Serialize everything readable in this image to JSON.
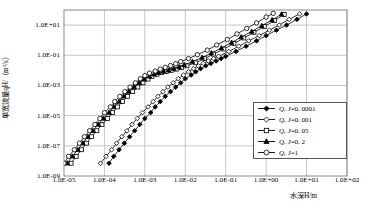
{
  "chart_data": {
    "type": "line",
    "title": "",
    "xlabel": "水深H/m",
    "ylabel": "单宽流量qH/（m³/s）",
    "xscale": "log",
    "yscale": "log",
    "xlim": [
      1e-05,
      100.0
    ],
    "ylim": [
      1e-09,
      100.0
    ],
    "grid": true,
    "xtick_labels": [
      "1.0E-05",
      "1.0E-04",
      "1.0E-03",
      "1.0E-02",
      "1.0E-01",
      "1.0E+00",
      "1.0E+01",
      "1.0E+02"
    ],
    "xtick_values": [
      1e-05,
      0.0001,
      0.001,
      0.01,
      0.1,
      1,
      10,
      100
    ],
    "ytick_labels": [
      "1.0E-09",
      "1.0E-07",
      "1.0E-05",
      "1.0E-03",
      "1.0E-01",
      "1.0E+01"
    ],
    "ytick_values": [
      1e-09,
      1e-07,
      1e-05,
      0.001,
      0.1,
      10
    ],
    "legend_position": "lower-right",
    "series": [
      {
        "name": "Q, J=0.0001",
        "marker": "filled-diamond",
        "points": [
          [
            0.00013,
            7e-09
          ],
          [
            0.00017,
            2e-08
          ],
          [
            0.00023,
            5.5e-08
          ],
          [
            0.00031,
            1.5e-07
          ],
          [
            0.00042,
            4e-07
          ],
          [
            0.00056,
            1e-06
          ],
          [
            0.00075,
            2.6e-06
          ],
          [
            0.001,
            6.5e-06
          ],
          [
            0.0014,
            1.6e-05
          ],
          [
            0.0018,
            3.8e-05
          ],
          [
            0.0024,
            8.5e-05
          ],
          [
            0.0032,
            0.00019
          ],
          [
            0.0043,
            0.00039
          ],
          [
            0.0058,
            0.00078
          ],
          [
            0.0077,
            0.0015
          ],
          [
            0.01,
            0.0028
          ],
          [
            0.014,
            0.0049
          ],
          [
            0.018,
            0.008
          ],
          [
            0.024,
            0.013
          ],
          [
            0.032,
            0.02
          ],
          [
            0.043,
            0.029
          ],
          [
            0.058,
            0.042
          ],
          [
            0.077,
            0.06
          ],
          [
            0.1,
            0.085
          ],
          [
            0.18,
            0.18
          ],
          [
            0.32,
            0.4
          ],
          [
            0.58,
            0.9
          ],
          [
            1.0,
            2.0
          ],
          [
            1.8,
            4.6
          ],
          [
            3.2,
            10.0
          ],
          [
            5.8,
            24.0
          ],
          [
            10.0,
            55.0
          ]
        ]
      },
      {
        "name": "Q, J=0.001",
        "marker": "open-diamond",
        "points": [
          [
            8e-05,
            7e-09
          ],
          [
            0.00011,
            2e-08
          ],
          [
            0.00015,
            5.5e-08
          ],
          [
            0.0002,
            1.5e-07
          ],
          [
            0.00027,
            4e-07
          ],
          [
            0.00036,
            1e-06
          ],
          [
            0.00048,
            2.6e-06
          ],
          [
            0.00065,
            6.5e-06
          ],
          [
            0.00087,
            1.6e-05
          ],
          [
            0.0012,
            3.8e-05
          ],
          [
            0.0016,
            8.5e-05
          ],
          [
            0.0021,
            0.00019
          ],
          [
            0.0028,
            0.00039
          ],
          [
            0.0037,
            0.00078
          ],
          [
            0.005,
            0.0015
          ],
          [
            0.0067,
            0.0028
          ],
          [
            0.009,
            0.0049
          ],
          [
            0.012,
            0.008
          ],
          [
            0.016,
            0.013
          ],
          [
            0.021,
            0.02
          ],
          [
            0.028,
            0.029
          ],
          [
            0.037,
            0.042
          ],
          [
            0.05,
            0.06
          ],
          [
            0.067,
            0.085
          ],
          [
            0.12,
            0.18
          ],
          [
            0.21,
            0.4
          ],
          [
            0.37,
            0.9
          ],
          [
            0.67,
            2.0
          ],
          [
            1.2,
            4.6
          ],
          [
            2.1,
            10.0
          ],
          [
            3.7,
            24.0
          ],
          [
            6.7,
            55.0
          ]
        ]
      },
      {
        "name": "Q, J=0.05",
        "marker": "open-square",
        "points": [
          [
            1.5e-05,
            7e-09
          ],
          [
            2e-05,
            2e-08
          ],
          [
            2.7e-05,
            5.5e-08
          ],
          [
            3.6e-05,
            1.5e-07
          ],
          [
            4.8e-05,
            4e-07
          ],
          [
            6.5e-05,
            1e-06
          ],
          [
            8.7e-05,
            2.6e-06
          ],
          [
            0.00012,
            6.5e-06
          ],
          [
            0.00016,
            1.6e-05
          ],
          [
            0.00021,
            3.8e-05
          ],
          [
            0.00028,
            8.5e-05
          ],
          [
            0.00037,
            0.00019
          ],
          [
            0.0005,
            0.00039
          ],
          [
            0.00067,
            0.00078
          ],
          [
            0.0009,
            0.0015
          ],
          [
            0.0012,
            0.0026
          ],
          [
            0.0015,
            0.004
          ],
          [
            0.002,
            0.0055
          ],
          [
            0.0026,
            0.007
          ],
          [
            0.0034,
            0.0085
          ],
          [
            0.0045,
            0.01
          ],
          [
            0.006,
            0.012
          ],
          [
            0.008,
            0.015
          ],
          [
            0.011,
            0.02
          ],
          [
            0.018,
            0.032
          ],
          [
            0.03,
            0.06
          ],
          [
            0.05,
            0.12
          ],
          [
            0.09,
            0.26
          ],
          [
            0.16,
            0.6
          ],
          [
            0.28,
            1.4
          ],
          [
            0.5,
            3.3
          ],
          [
            0.9,
            8.0
          ],
          [
            1.6,
            20.0
          ],
          [
            2.8,
            50.0
          ]
        ]
      },
      {
        "name": "Q, J=0.2",
        "marker": "filled-triangle",
        "points": [
          [
            1.2e-05,
            7e-09
          ],
          [
            1.6e-05,
            2e-08
          ],
          [
            2.2e-05,
            5.5e-08
          ],
          [
            2.9e-05,
            1.5e-07
          ],
          [
            3.9e-05,
            4e-07
          ],
          [
            5.2e-05,
            1e-06
          ],
          [
            7e-05,
            2.6e-06
          ],
          [
            9.4e-05,
            6.5e-06
          ],
          [
            0.00013,
            1.6e-05
          ],
          [
            0.00017,
            3.8e-05
          ],
          [
            0.00023,
            8.5e-05
          ],
          [
            0.0003,
            0.00019
          ],
          [
            0.0004,
            0.00039
          ],
          [
            0.00054,
            0.00078
          ],
          [
            0.00072,
            0.0015
          ],
          [
            0.00096,
            0.0026
          ],
          [
            0.0013,
            0.004
          ],
          [
            0.0017,
            0.0055
          ],
          [
            0.0022,
            0.007
          ],
          [
            0.0029,
            0.0085
          ],
          [
            0.0039,
            0.01
          ],
          [
            0.0052,
            0.013
          ],
          [
            0.007,
            0.017
          ],
          [
            0.0094,
            0.023
          ],
          [
            0.015,
            0.038
          ],
          [
            0.026,
            0.07
          ],
          [
            0.044,
            0.14
          ],
          [
            0.078,
            0.3
          ],
          [
            0.14,
            0.7
          ],
          [
            0.24,
            1.6
          ],
          [
            0.44,
            3.8
          ],
          [
            0.78,
            9.0
          ],
          [
            1.4,
            22.0
          ],
          [
            2.4,
            52.0
          ]
        ]
      },
      {
        "name": "Q, J=1",
        "marker": "open-circle",
        "points": [
          [
            1e-05,
            7e-09
          ],
          [
            1.3e-05,
            2e-08
          ],
          [
            1.8e-05,
            5.5e-08
          ],
          [
            2.4e-05,
            1.5e-07
          ],
          [
            3.2e-05,
            4e-07
          ],
          [
            4.3e-05,
            1e-06
          ],
          [
            5.8e-05,
            2.6e-06
          ],
          [
            7.7e-05,
            6.5e-06
          ],
          [
            0.0001,
            1.6e-05
          ],
          [
            0.00014,
            3.8e-05
          ],
          [
            0.00018,
            8.5e-05
          ],
          [
            0.00024,
            0.00019
          ],
          [
            0.00032,
            0.00039
          ],
          [
            0.00043,
            0.00078
          ],
          [
            0.00058,
            0.0015
          ],
          [
            0.00077,
            0.0028
          ],
          [
            0.001,
            0.0045
          ],
          [
            0.0013,
            0.0065
          ],
          [
            0.0018,
            0.009
          ],
          [
            0.0024,
            0.012
          ],
          [
            0.0032,
            0.016
          ],
          [
            0.0043,
            0.021
          ],
          [
            0.0058,
            0.028
          ],
          [
            0.0077,
            0.038
          ],
          [
            0.012,
            0.06
          ],
          [
            0.02,
            0.11
          ],
          [
            0.035,
            0.22
          ],
          [
            0.06,
            0.48
          ],
          [
            0.11,
            1.1
          ],
          [
            0.19,
            2.6
          ],
          [
            0.33,
            6.0
          ],
          [
            0.58,
            14.0
          ],
          [
            1.0,
            34.0
          ],
          [
            1.5,
            60.0
          ]
        ]
      }
    ]
  },
  "legend": {
    "items": [
      {
        "label": "Q, J=0.0001",
        "q": "Q",
        "j": "J",
        "value": "=0. 0001",
        "marker": "filled-diamond"
      },
      {
        "label": "Q, J=0.001",
        "q": "Q",
        "j": "J",
        "value": "=0. 001",
        "marker": "open-diamond"
      },
      {
        "label": "Q, J=0.05",
        "q": "Q",
        "j": "J",
        "value": "=0. 05",
        "marker": "open-square"
      },
      {
        "label": "Q, J=0.2",
        "q": "Q",
        "j": "J",
        "value": "=0. 2",
        "marker": "filled-triangle"
      },
      {
        "label": "Q, J=1",
        "q": "Q",
        "j": "J",
        "value": "=1",
        "marker": "open-circle"
      }
    ]
  },
  "axes": {
    "y_title_pre": "单宽流量",
    "y_title_sym": "qH",
    "y_title_post": "/（m³/s）",
    "x_title_pre": "水深",
    "x_title_sym": "H",
    "x_title_post": "/m"
  },
  "colors": {
    "grid": "#b8b8b8",
    "frame": "#8a8a8a",
    "ink": "#000000",
    "legend_border": "#666666"
  }
}
